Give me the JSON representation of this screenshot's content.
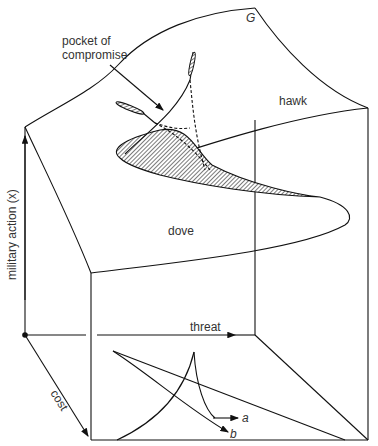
{
  "diagram": {
    "type": "cusp catastrophe surface",
    "labels": {
      "surface": "G",
      "pocket_line1": "pocket of",
      "pocket_line2": "compromise",
      "upper_sheet": "hawk",
      "lower_sheet": "dove",
      "vertical_axis": "military action (x)",
      "threat_axis": "threat",
      "cost_axis": "cost",
      "path_a": "a",
      "path_b": "b"
    },
    "colors": {
      "stroke": "#111111",
      "text": "#333333",
      "background": "#ffffff"
    }
  }
}
